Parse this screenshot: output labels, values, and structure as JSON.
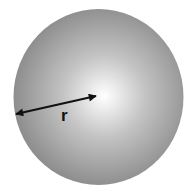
{
  "diagram": {
    "radius_label": "r",
    "colors": {
      "sphere_center": "#ffffff",
      "sphere_mid": "#c4c4c4",
      "sphere_edge": "#8e8e8e",
      "arrow": "#111111",
      "label": "#111111",
      "background": "#ffffff"
    }
  }
}
